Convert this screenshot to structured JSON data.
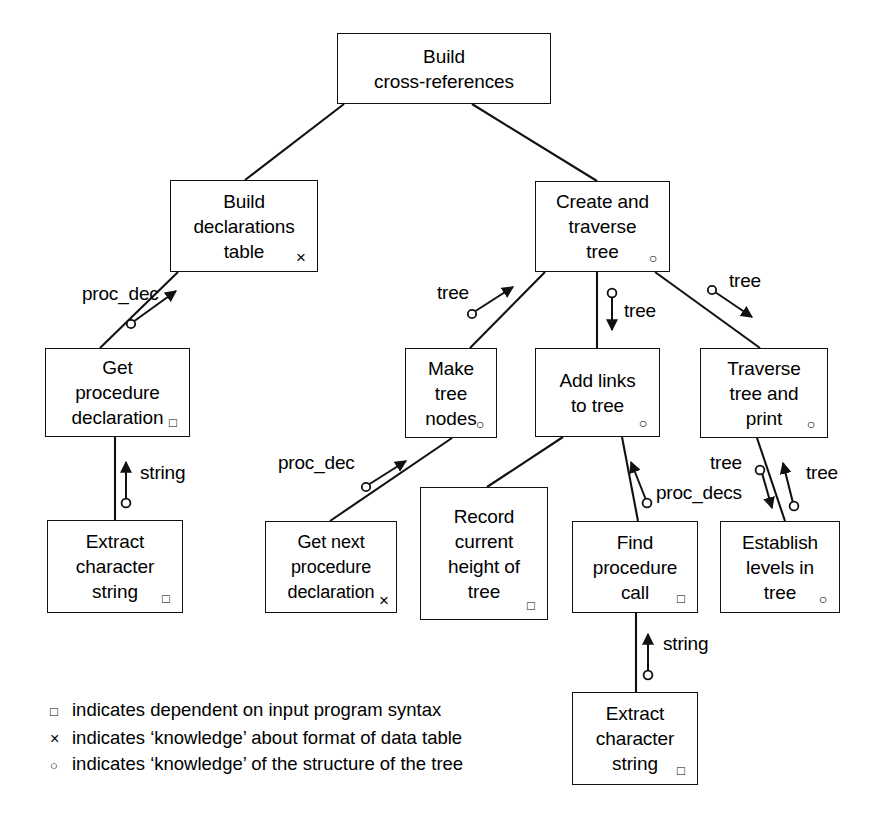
{
  "diagram": {
    "line_color": "#111111",
    "background": "#ffffff",
    "nodes": [
      {
        "id": "root",
        "label": "Build\ncross-references",
        "marker": ""
      },
      {
        "id": "build_decl",
        "label": "Build\ndeclarations\ntable",
        "marker": "×"
      },
      {
        "id": "create_trav",
        "label": "Create and\ntraverse\ntree",
        "marker": "○"
      },
      {
        "id": "get_proc",
        "label": "Get\nprocedure\ndeclaration",
        "marker": "□"
      },
      {
        "id": "make_nodes",
        "label": "Make\ntree\nnodes",
        "marker": "○"
      },
      {
        "id": "add_links",
        "label": "Add links\nto tree",
        "marker": "○"
      },
      {
        "id": "traverse",
        "label": "Traverse\ntree and\nprint",
        "marker": "○"
      },
      {
        "id": "extract1",
        "label": "Extract\ncharacter\nstring",
        "marker": "□"
      },
      {
        "id": "get_next",
        "label": "Get next\nprocedure\ndeclaration",
        "marker": "×"
      },
      {
        "id": "record",
        "label": "Record\ncurrent\nheight of\ntree",
        "marker": "□"
      },
      {
        "id": "find_call",
        "label": "Find\nprocedure\ncall",
        "marker": "□"
      },
      {
        "id": "establish",
        "label": "Establish\nlevels in\ntree",
        "marker": "○"
      },
      {
        "id": "extract2",
        "label": "Extract\ncharacter\nstring",
        "marker": "□"
      }
    ],
    "flow_labels": [
      {
        "id": "flow-proc-dec-1",
        "text": "proc_dec"
      },
      {
        "id": "flow-string-1",
        "text": "string"
      },
      {
        "id": "flow-tree-1",
        "text": "tree"
      },
      {
        "id": "flow-tree-2",
        "text": "tree"
      },
      {
        "id": "flow-tree-3",
        "text": "tree"
      },
      {
        "id": "flow-proc-dec-2",
        "text": "proc_dec"
      },
      {
        "id": "flow-proc-decs",
        "text": "proc_decs"
      },
      {
        "id": "flow-tree-4",
        "text": "tree"
      },
      {
        "id": "flow-tree-5",
        "text": "tree"
      },
      {
        "id": "flow-string-2",
        "text": "string"
      }
    ],
    "legend": [
      {
        "symbol": "□",
        "text": "indicates dependent on input program syntax"
      },
      {
        "symbol": "×",
        "text": "indicates ‘knowledge’ about format of data table"
      },
      {
        "symbol": "○",
        "text": "indicates ‘knowledge’ of the structure of the tree"
      }
    ]
  }
}
